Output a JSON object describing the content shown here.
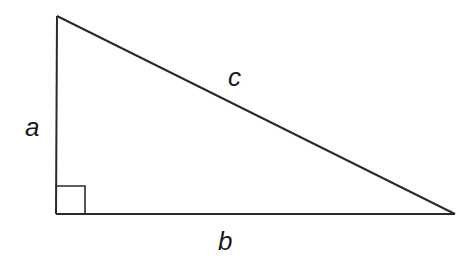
{
  "diagram": {
    "type": "right-triangle",
    "vertices": {
      "top": [
        57,
        16
      ],
      "right_angle": [
        56,
        214
      ],
      "right": [
        455,
        214
      ]
    },
    "right_angle_marker": {
      "size": 29
    },
    "stroke_color": "#2a2a2a",
    "labels": {
      "a": {
        "text": "a",
        "side": "vertical leg"
      },
      "b": {
        "text": "b",
        "side": "horizontal leg"
      },
      "c": {
        "text": "c",
        "side": "hypotenuse"
      }
    }
  }
}
